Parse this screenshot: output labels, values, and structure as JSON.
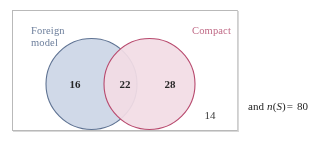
{
  "diagram": {
    "type": "venn-two-set",
    "universal_set_label": "S",
    "sets": [
      {
        "id": "foreign-model",
        "label": "Foreign\nmodel",
        "label_color": "#6d7f9c",
        "fill_color": "#ccd6e6",
        "stroke_color": "#5f7393",
        "position": "left"
      },
      {
        "id": "compact",
        "label": "Compact",
        "label_color": "#c06a86",
        "fill_color": "#f2dde5",
        "stroke_color": "#b84a6e",
        "position": "right"
      }
    ],
    "intersection_fill_color": "#b9aec6",
    "regions": [
      {
        "id": "left-only",
        "label": "Foreign model only",
        "value": "16"
      },
      {
        "id": "both",
        "label": "Foreign model and Compact",
        "value": "22"
      },
      {
        "id": "right-only",
        "label": "Compact only",
        "value": "28"
      },
      {
        "id": "outside",
        "label": "Neither",
        "value": "14"
      }
    ],
    "counts": {
      "left_only": "16",
      "both": "22",
      "right_only": "28",
      "outside": "14"
    }
  },
  "note": {
    "prefix": "and ",
    "function_name": "n",
    "open_paren": "(",
    "argument": "S",
    "close_paren": ")",
    "equals": "=",
    "total": "80",
    "full_text": "and n(S ) = 80"
  },
  "colors": {
    "frame_border": "#b9b9b9",
    "page_background": "#ffffff",
    "blue_fill": "#ccd6e6",
    "blue_stroke": "#5f7393",
    "pink_fill": "#f2dde5",
    "pink_stroke": "#b84a6e",
    "overlap_fill": "#b3a8c0",
    "number_text": "#262626"
  }
}
